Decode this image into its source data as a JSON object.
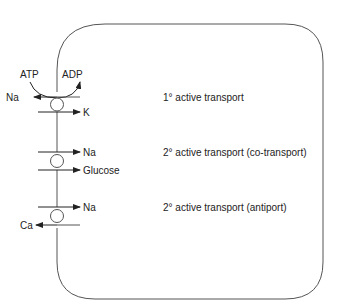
{
  "diagram": {
    "colors": {
      "stroke": "#555555",
      "text": "#222222",
      "background": "#ffffff"
    },
    "energy": {
      "atp": "ATP",
      "adp": "ADP"
    },
    "transporters": [
      {
        "type_label": "1° active transport",
        "out_ion": "Na",
        "in_ion": "K"
      },
      {
        "type_label": "2° active transport (co-transport)",
        "in_ion_1": "Na",
        "in_ion_2": "Glucose"
      },
      {
        "type_label": "2° active transport (antiport)",
        "in_ion": "Na",
        "out_ion": "Ca"
      }
    ]
  }
}
